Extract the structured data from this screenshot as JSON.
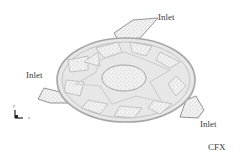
{
  "figure": {
    "labels": {
      "inlet_top": "Inlet",
      "inlet_left": "Inlet",
      "inlet_right": "Inlet",
      "software": "CFX"
    },
    "axes": {
      "y": "y",
      "x": "x"
    },
    "colors": {
      "disk_fill": "#e6e6e6",
      "disk_edge": "#a8a8a8",
      "speckle_fill": "#f2f2f2",
      "speckle_dot": "#9a9a9a",
      "text": "#3a3a3a"
    }
  }
}
